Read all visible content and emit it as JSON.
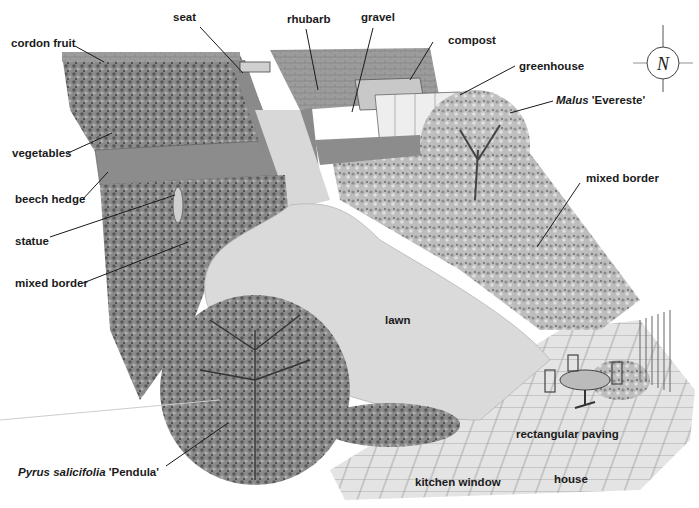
{
  "diagram": {
    "type": "garden-plan-illustration",
    "style": "monochrome pencil illustration, oblique aerial view",
    "compass": {
      "icon": "north-compass-icon",
      "letter": "N"
    },
    "labels": {
      "cordon_fruit": "cordon fruit",
      "seat": "seat",
      "rhubarb": "rhubarb",
      "gravel": "gravel",
      "compost": "compost",
      "greenhouse": "greenhouse",
      "malus_genus": "Malus",
      "malus_cultivar": "'Evereste'",
      "vegetables": "vegetables",
      "beech_hedge": "beech hedge",
      "statue": "statue",
      "mixed_border_left": "mixed border",
      "mixed_border_right": "mixed border",
      "lawn": "lawn",
      "pyrus_species": "Pyrus salicifolia",
      "pyrus_cultivar": "'Pendula'",
      "rectangular_paving": "rectangular paving",
      "kitchen_window": "kitchen window",
      "house": "house"
    },
    "colors": {
      "paper": "#ffffff",
      "wall": "#9a9a9a",
      "wall_dark": "#6e6e6e",
      "foliage": "#7d7d7d",
      "foliage_dark": "#4a4a4a",
      "lawn": "#d9d9d9",
      "paving": "#e6e6e6",
      "ink": "#1a1a1a"
    }
  }
}
